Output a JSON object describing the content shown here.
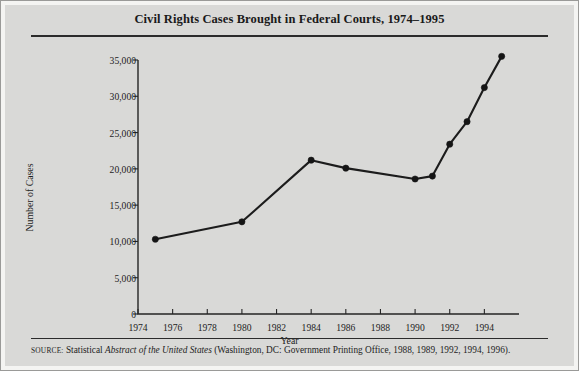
{
  "figure": {
    "title": "Civil Rights Cases Brought in Federal Courts, 1974–1995",
    "source_label": "SOURCE:",
    "source_text_1": " Statistical ",
    "source_text_italic": "Abstract of the United States",
    "source_text_2": " (Washington, DC: Government Printing Office, 1988, 1989, 1992, 1994, 1996).",
    "background_color": "#d9d9d7",
    "line_color": "#1c1c1c",
    "text_color": "#1d1d1d"
  },
  "chart_data": {
    "type": "line",
    "title": "Civil Rights Cases Brought in Federal Courts, 1974–1995",
    "xlabel": "Year",
    "ylabel": "Number of Cases",
    "xlim": [
      1974,
      1996
    ],
    "ylim": [
      0,
      35000
    ],
    "grid": false,
    "legend": "none",
    "x_tick_labels": [
      "1974",
      "1976",
      "1978",
      "1980",
      "1982",
      "1984",
      "1986",
      "1988",
      "1990",
      "1992",
      "1994"
    ],
    "x_tick_values": [
      1974,
      1976,
      1978,
      1980,
      1982,
      1984,
      1986,
      1988,
      1990,
      1992,
      1994
    ],
    "y_tick_labels": [
      "0",
      "5,000",
      "10,000",
      "15,000",
      "20,000",
      "25,000",
      "30,000",
      "35,000"
    ],
    "y_tick_values": [
      0,
      5000,
      10000,
      15000,
      20000,
      25000,
      30000,
      35000
    ],
    "series": [
      {
        "name": "Civil Rights Cases",
        "x": [
          1975,
          1980,
          1984,
          1986,
          1990,
          1991,
          1992,
          1993,
          1994,
          1995
        ],
        "values": [
          10300,
          12700,
          21200,
          20100,
          18600,
          19000,
          23400,
          26500,
          31200,
          35500
        ]
      }
    ]
  }
}
